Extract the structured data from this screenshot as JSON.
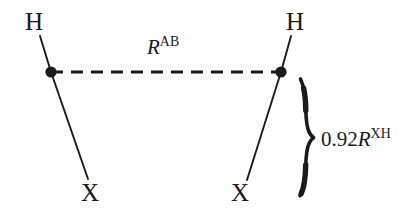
{
  "figure": {
    "type": "molecular-geometry-diagram",
    "background_color": "#ffffff",
    "stroke_color": "#1a1a1a"
  },
  "atoms": [
    {
      "id": "h-left",
      "label": "H",
      "x": 35,
      "y": 22
    },
    {
      "id": "h-right",
      "label": "H",
      "x": 295,
      "y": 22
    },
    {
      "id": "x-left",
      "label": "X",
      "x": 91,
      "y": 193
    },
    {
      "id": "x-right",
      "label": "X",
      "x": 241,
      "y": 193
    }
  ],
  "centres": [
    {
      "id": "centre-a",
      "x": 51,
      "y": 72
    },
    {
      "id": "centre-b",
      "x": 281,
      "y": 72
    }
  ],
  "labels": {
    "separation": {
      "number": "",
      "symbol": "R",
      "superscript": "AB",
      "text": "R^AB"
    },
    "bond": {
      "number": "0.92",
      "symbol": "R",
      "superscript": "XH",
      "text": "0.92R^XH"
    }
  },
  "brace": {
    "orientation": "left-pointing",
    "top_y": 78,
    "bottom_y": 196,
    "tip_x": 313,
    "tip_y": 138
  },
  "connector": {
    "style": "dashed",
    "from": "centre-a",
    "to": "centre-b",
    "dash_length": 12,
    "gap_length": 8
  }
}
